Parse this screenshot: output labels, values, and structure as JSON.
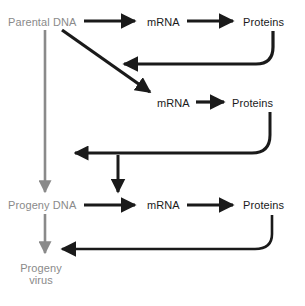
{
  "diagram": {
    "colors": {
      "dna_text": "#8a8a8a",
      "replication_arrow": "#8a8a8a",
      "expression_text": "#1a1a1a",
      "expression_arrow": "#1a1a1a",
      "background": "#ffffff"
    },
    "nodes": {
      "parental_dna": "Parental DNA",
      "mrna_1": "mRNA",
      "proteins_1": "Proteins",
      "mrna_2": "mRNA",
      "proteins_2": "Proteins",
      "progeny_dna": "Progeny DNA",
      "mrna_3": "mRNA",
      "proteins_3": "Proteins",
      "progeny_virus_line1": "Progeny",
      "progeny_virus_line2": "virus"
    },
    "edges": [
      {
        "id": "parental-dna-to-mrna-1",
        "from": "Parental DNA",
        "to": "mRNA",
        "style": "straight-black-right"
      },
      {
        "id": "mrna-1-to-proteins-1",
        "from": "mRNA",
        "to": "Proteins",
        "style": "straight-black-right"
      },
      {
        "id": "proteins-1-feedback",
        "from": "Proteins",
        "to": "transcription-step-2",
        "style": "curved-black-left"
      },
      {
        "id": "parental-dna-to-mrna-2",
        "from": "Parental DNA",
        "to": "mRNA",
        "style": "diagonal-black-down-right"
      },
      {
        "id": "mrna-2-to-proteins-2",
        "from": "mRNA",
        "to": "Proteins",
        "style": "straight-black-right"
      },
      {
        "id": "proteins-2-feedback",
        "from": "Proteins",
        "to": "replication-step",
        "style": "curved-black-left"
      },
      {
        "id": "feedback-branch-down",
        "from": "proteins-2-feedback",
        "to": "Progeny DNA transcription",
        "style": "straight-black-down"
      },
      {
        "id": "parental-dna-to-progeny-dna",
        "from": "Parental DNA",
        "to": "Progeny DNA",
        "style": "straight-gray-down"
      },
      {
        "id": "progeny-dna-to-mrna-3",
        "from": "Progeny DNA",
        "to": "mRNA",
        "style": "straight-black-right"
      },
      {
        "id": "mrna-3-to-proteins-3",
        "from": "mRNA",
        "to": "Proteins",
        "style": "straight-black-right"
      },
      {
        "id": "proteins-3-feedback",
        "from": "Proteins",
        "to": "assembly",
        "style": "curved-black-left"
      },
      {
        "id": "progeny-dna-to-progeny-virus",
        "from": "Progeny DNA",
        "to": "Progeny virus",
        "style": "straight-gray-down"
      }
    ]
  }
}
